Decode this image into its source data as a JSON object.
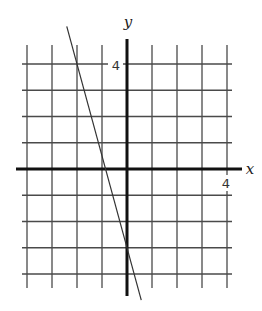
{
  "chart_data": {
    "type": "line",
    "title": "",
    "xlabel": "x",
    "ylabel": "y",
    "xlim": [
      -4,
      4
    ],
    "ylim": [
      -4,
      4
    ],
    "grid": true,
    "grid_step": 1,
    "x_tick_labels": [
      {
        "value": 4,
        "label": "4"
      }
    ],
    "y_tick_labels": [
      {
        "value": 4,
        "label": "4"
      }
    ],
    "series": [
      {
        "name": "line",
        "equation": "y = -3.5x - 3",
        "slope": -3.5,
        "intercept": -3,
        "points": [
          {
            "x": -2,
            "y": 4
          },
          {
            "x": 0,
            "y": -3
          }
        ],
        "x_range_drawn": [
          -2.41,
          0.57
        ],
        "color": "#333333"
      }
    ],
    "legend": null
  },
  "labels": {
    "x_axis": "x",
    "y_axis": "y",
    "x_tick": "4",
    "y_tick": "4"
  },
  "colors": {
    "grid": "#4a4a4a",
    "axis": "#111111",
    "line": "#333333",
    "background": "#ffffff"
  }
}
